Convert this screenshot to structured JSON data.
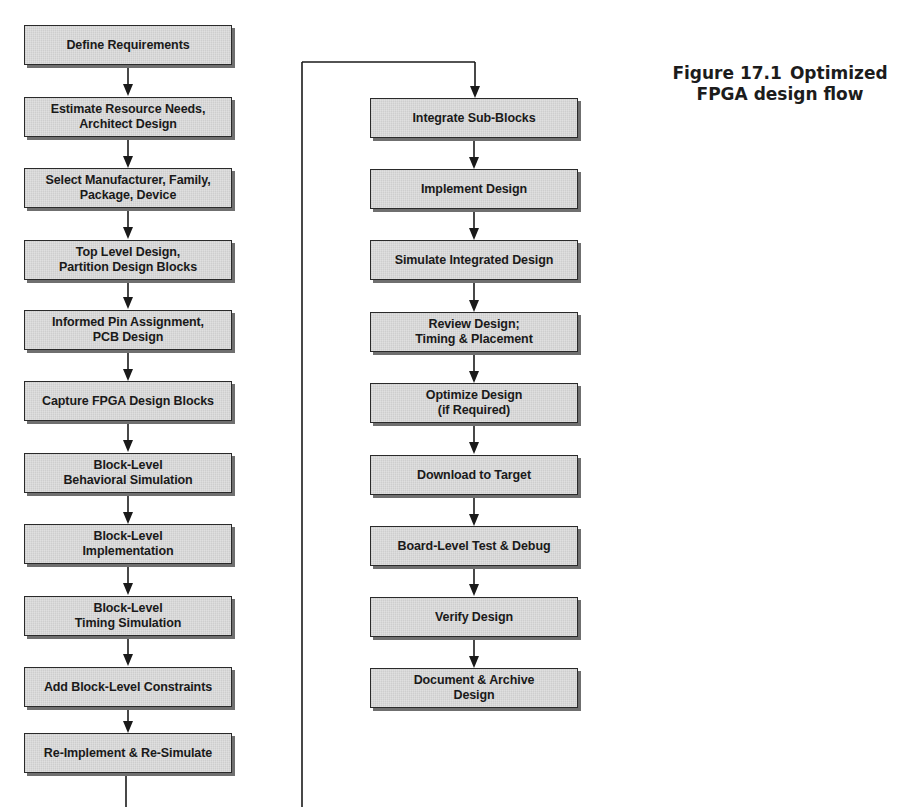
{
  "figure": {
    "caption_number": "Figure 17.1",
    "caption_title": "Optimized FPGA design flow",
    "caption_line1_title": "Optimized",
    "caption_line2": "FPGA design flow",
    "box_fill": "#d9d9d9",
    "box_border": "#2a2a2a",
    "box_shadow": "#6f6f6f",
    "line_color": "#1a1a1a"
  },
  "left_column": {
    "steps": [
      {
        "label": "Define Requirements"
      },
      {
        "label": "Estimate Resource Needs,\nArchitect Design"
      },
      {
        "label": "Select Manufacturer, Family,\nPackage, Device"
      },
      {
        "label": "Top Level Design,\nPartition Design Blocks"
      },
      {
        "label": "Informed Pin Assignment,\nPCB Design"
      },
      {
        "label": "Capture FPGA Design Blocks"
      },
      {
        "label": "Block-Level\nBehavioral Simulation"
      },
      {
        "label": "Block-Level\nImplementation"
      },
      {
        "label": "Block-Level\nTiming Simulation"
      },
      {
        "label": "Add Block-Level Constraints"
      },
      {
        "label": "Re-Implement & Re-Simulate"
      }
    ]
  },
  "right_column": {
    "steps": [
      {
        "label": "Integrate Sub-Blocks"
      },
      {
        "label": "Implement Design"
      },
      {
        "label": "Simulate Integrated Design"
      },
      {
        "label": "Review Design;\nTiming & Placement"
      },
      {
        "label": "Optimize Design\n(if Required)"
      },
      {
        "label": "Download to Target"
      },
      {
        "label": "Board-Level Test & Debug"
      },
      {
        "label": "Verify Design"
      },
      {
        "label": "Document & Archive\nDesign"
      }
    ]
  }
}
